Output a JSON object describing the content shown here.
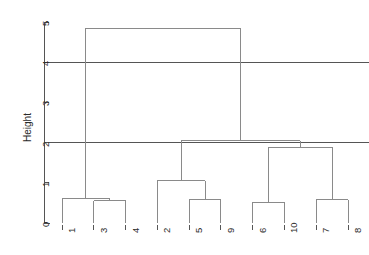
{
  "axis_label_y": "Height",
  "chart_data": {
    "type": "dendrogram",
    "title": "",
    "xlabel": "",
    "ylabel": "Height",
    "ylim": [
      0,
      5
    ],
    "yticks": [
      0,
      1,
      2,
      3,
      4,
      5
    ],
    "ytick_labels": [
      "0",
      "1",
      "2",
      "3",
      "4",
      "5"
    ],
    "grid": false,
    "legend": "none",
    "leaf_order": [
      "1",
      "3",
      "4",
      "2",
      "5",
      "9",
      "6",
      "10",
      "7",
      "8"
    ],
    "leaf_labels": [
      "1",
      "3",
      "4",
      "2",
      "5",
      "9",
      "6",
      "10",
      "7",
      "8"
    ],
    "line_color": "#8a8a8a",
    "axis_color": "#555555",
    "merges": [
      {
        "id": "m1",
        "left": "3",
        "right": "4",
        "height": 0.55
      },
      {
        "id": "m2",
        "left": "1",
        "right": "m1",
        "height": 0.62
      },
      {
        "id": "m3",
        "left": "5",
        "right": "9",
        "height": 0.58
      },
      {
        "id": "m4",
        "left": "2",
        "right": "m3",
        "height": 1.05
      },
      {
        "id": "m5",
        "left": "6",
        "right": "10",
        "height": 0.52
      },
      {
        "id": "m6",
        "left": "7",
        "right": "8",
        "height": 0.58
      },
      {
        "id": "m7",
        "left": "m5",
        "right": "m6",
        "height": 1.88
      },
      {
        "id": "m8",
        "left": "m4",
        "right": "m7",
        "height": 2.05
      },
      {
        "id": "m9",
        "left": "m2",
        "right": "m8",
        "height": 4.85
      }
    ],
    "cut_lines": [
      {
        "height": 4.0,
        "color": "#555555"
      },
      {
        "height": 2.0,
        "color": "#555555"
      }
    ]
  }
}
